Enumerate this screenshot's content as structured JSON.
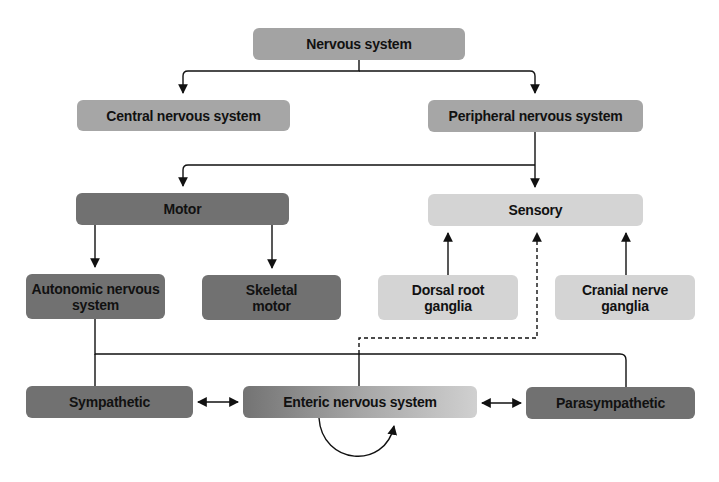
{
  "diagram": {
    "title": "Nervous system",
    "nodes": {
      "nervous_system": "Nervous system",
      "central": "Central nervous system",
      "peripheral": "Peripheral nervous system",
      "motor": "Motor",
      "sensory": "Sensory",
      "autonomic": "Autonomic nervous system",
      "skeletal": "Skeletal motor",
      "dorsal": "Dorsal root ganglia",
      "cranial": "Cranial nerve ganglia",
      "sympathetic": "Sympathetic",
      "enteric": "Enteric nervous system",
      "parasympathetic": "Parasympathetic"
    },
    "edges": [
      {
        "from": "Nervous system",
        "to": "Central nervous system",
        "style": "solid",
        "arrow": "end"
      },
      {
        "from": "Nervous system",
        "to": "Peripheral nervous system",
        "style": "solid",
        "arrow": "end"
      },
      {
        "from": "Peripheral nervous system",
        "to": "Motor",
        "style": "solid",
        "arrow": "end"
      },
      {
        "from": "Peripheral nervous system",
        "to": "Sensory",
        "style": "solid",
        "arrow": "end"
      },
      {
        "from": "Motor",
        "to": "Autonomic nervous system",
        "style": "solid",
        "arrow": "end"
      },
      {
        "from": "Motor",
        "to": "Skeletal motor",
        "style": "solid",
        "arrow": "end"
      },
      {
        "from": "Dorsal root ganglia",
        "to": "Sensory",
        "style": "solid",
        "arrow": "end"
      },
      {
        "from": "Cranial nerve ganglia",
        "to": "Sensory",
        "style": "solid",
        "arrow": "end"
      },
      {
        "from": "Autonomic nervous system",
        "to": "Sympathetic",
        "style": "solid",
        "arrow": "none"
      },
      {
        "from": "Autonomic nervous system",
        "to": "Enteric nervous system",
        "style": "solid",
        "arrow": "none"
      },
      {
        "from": "Autonomic nervous system",
        "to": "Parasympathetic",
        "style": "solid",
        "arrow": "none"
      },
      {
        "from": "Enteric nervous system",
        "to": "Sensory",
        "style": "dashed",
        "arrow": "end"
      },
      {
        "from": "Sympathetic",
        "to": "Enteric nervous system",
        "style": "solid",
        "arrow": "both"
      },
      {
        "from": "Enteric nervous system",
        "to": "Parasympathetic",
        "style": "solid",
        "arrow": "both"
      },
      {
        "from": "Enteric nervous system",
        "to": "Enteric nervous system",
        "style": "solid",
        "arrow": "end",
        "shape": "loop"
      }
    ],
    "colors": {
      "top_level": "#a3a3a3",
      "motor_branch": "#717171",
      "sensory_branch": "#d4d4d4",
      "enteric_gradient_start": "#737373",
      "enteric_gradient_end": "#d0d0d0",
      "line": "#111111"
    }
  }
}
